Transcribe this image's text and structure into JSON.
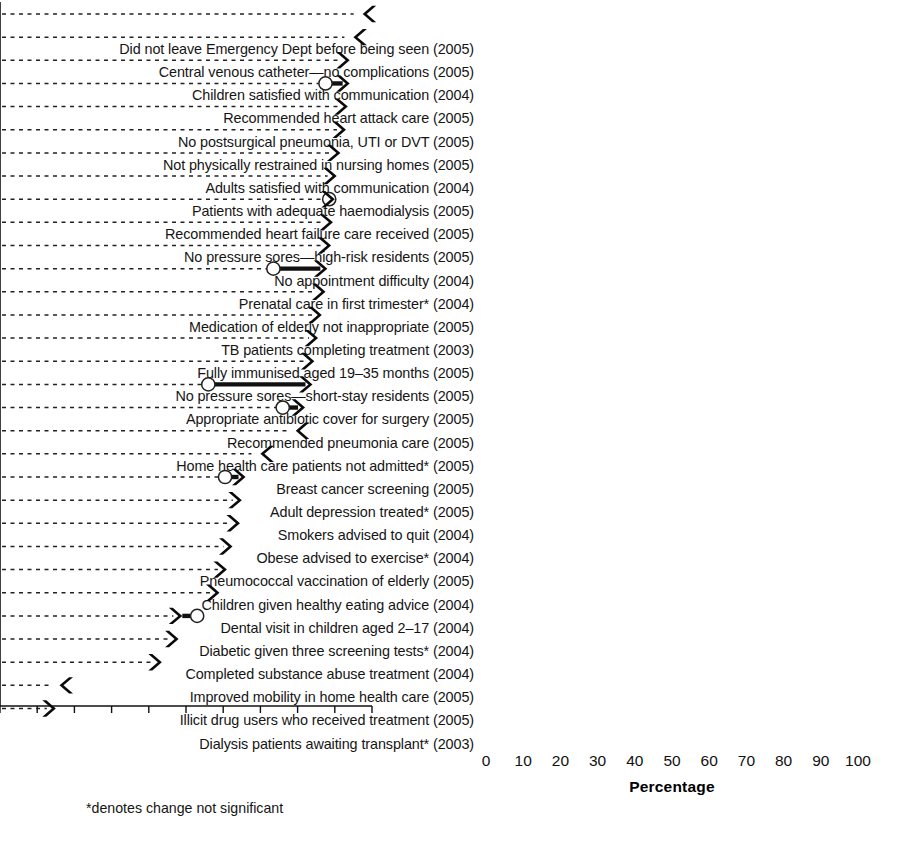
{
  "figure": {
    "footnote": "*denotes change not significant",
    "axis_title": "Percentage"
  },
  "chart_data": {
    "type": "bar",
    "orientation": "horizontal",
    "title": "",
    "xlabel": "Percentage",
    "ylabel": "",
    "xlim": [
      0,
      100
    ],
    "xticks": [
      0,
      10,
      20,
      30,
      40,
      50,
      60,
      70,
      80,
      90,
      100
    ],
    "grid": "dashed horizontal leader lines",
    "legend": null,
    "annotation": "*denotes change not significant",
    "marker_semantics": {
      "arrow": "current value / direction of change",
      "open_circle": "baseline (previous) value",
      "solid_bar": "magnitude of change"
    },
    "categories": [
      "Did not leave Emergency Dept before being seen (2005)",
      "Central venous catheter—no complications (2005)",
      "Children satisfied with communication (2004)",
      "Recommended heart attack care (2005)",
      "No postsurgical pneumonia, UTI or DVT (2005)",
      "Not physically restrained in nursing homes (2005)",
      "Adults satisfied with communication (2004)",
      "Patients with adequate haemodialysis (2005)",
      "Recommended heart failure care received (2005)",
      "No pressure sores—high-risk residents (2005)",
      "No appointment difficulty (2004)",
      "Prenatal care in first trimester* (2004)",
      "Medication of elderly not inappropriate (2005)",
      "TB patients completing treatment (2003)",
      "Fully immunised aged 19–35 months (2005)",
      "No pressure sores—short-stay residents (2005)",
      "Appropriate antibiotic cover for surgery (2005)",
      "Recommended pneumonia care (2005)",
      "Home health care patients not admitted* (2005)",
      "Breast cancer screening (2005)",
      "Adult depression treated* (2005)",
      "Smokers advised to quit (2004)",
      "Obese advised to exercise* (2004)",
      "Pneumococcal vaccination of elderly (2005)",
      "Children given healthy eating advice (2004)",
      "Dental visit in children aged 2–17 (2004)",
      "Diabetic given three screening tests* (2004)",
      "Completed substance abuse treatment (2004)",
      "Improved mobility in home health care (2005)",
      "Illicit drug users who received treatment (2005)",
      "Dialysis patients awaiting transplant* (2003)"
    ],
    "series": [
      {
        "name": "Current value (%)",
        "values": [
          97.5,
          95,
          94,
          94,
          93.5,
          93,
          91.5,
          90.5,
          90,
          89.5,
          89,
          88,
          87.5,
          86.5,
          85.5,
          84.5,
          84,
          82,
          79.5,
          70,
          66,
          65,
          64.5,
          62.5,
          61,
          59,
          49,
          48,
          43.5,
          16,
          15
        ]
      },
      {
        "name": "Baseline value (%)",
        "values": [
          null,
          null,
          null,
          87.5,
          null,
          null,
          null,
          null,
          88.5,
          null,
          null,
          73.5,
          null,
          null,
          null,
          null,
          56,
          76,
          null,
          null,
          60.5,
          null,
          null,
          null,
          null,
          null,
          53,
          null,
          null,
          null,
          null
        ]
      }
    ],
    "direction": [
      "left",
      "left",
      "right",
      "right",
      "right",
      "right",
      "right",
      "right",
      "right",
      "right",
      "right",
      "right",
      "right",
      "right",
      "right",
      "right",
      "right",
      "right",
      "left",
      "left",
      "right",
      "right",
      "right",
      "right",
      "right",
      "right",
      "right",
      "right",
      "right",
      "left",
      "right"
    ],
    "significant": [
      true,
      true,
      true,
      true,
      true,
      true,
      true,
      true,
      true,
      true,
      true,
      false,
      true,
      true,
      true,
      true,
      true,
      true,
      false,
      true,
      false,
      true,
      false,
      true,
      true,
      true,
      false,
      true,
      true,
      true,
      false
    ]
  },
  "rows": [
    {
      "label": "Did not leave Emergency Dept before being seen (2005)",
      "value": 97.5,
      "baseline": null,
      "dir": "left"
    },
    {
      "label": "Central venous catheter—no complications (2005)",
      "value": 95,
      "baseline": null,
      "dir": "left"
    },
    {
      "label": "Children satisfied with communication (2004)",
      "value": 94,
      "baseline": null,
      "dir": "right"
    },
    {
      "label": "Recommended heart attack care (2005)",
      "value": 94,
      "baseline": 87.5,
      "dir": "right"
    },
    {
      "label": "No postsurgical pneumonia, UTI or DVT (2005)",
      "value": 93.5,
      "baseline": null,
      "dir": "right"
    },
    {
      "label": "Not physically restrained in nursing homes (2005)",
      "value": 93,
      "baseline": null,
      "dir": "right"
    },
    {
      "label": "Adults satisfied with communication (2004)",
      "value": 91.5,
      "baseline": null,
      "dir": "right"
    },
    {
      "label": "Patients with adequate haemodialysis (2005)",
      "value": 90.5,
      "baseline": null,
      "dir": "right"
    },
    {
      "label": "Recommended heart failure care received (2005)",
      "value": 90,
      "baseline": 88.5,
      "dir": "right"
    },
    {
      "label": "No pressure sores—high-risk residents (2005)",
      "value": 89.5,
      "baseline": null,
      "dir": "right"
    },
    {
      "label": "No appointment difficulty (2004)",
      "value": 89,
      "baseline": null,
      "dir": "right"
    },
    {
      "label": "Prenatal care in first trimester* (2004)",
      "value": 88,
      "baseline": 73.5,
      "dir": "right"
    },
    {
      "label": "Medication of elderly not inappropriate (2005)",
      "value": 87.5,
      "baseline": null,
      "dir": "right"
    },
    {
      "label": "TB patients completing treatment (2003)",
      "value": 86.5,
      "baseline": null,
      "dir": "right"
    },
    {
      "label": "Fully immunised aged 19–35 months (2005)",
      "value": 85.5,
      "baseline": null,
      "dir": "right"
    },
    {
      "label": "No pressure sores—short-stay residents (2005)",
      "value": 84.5,
      "baseline": null,
      "dir": "right"
    },
    {
      "label": "Appropriate antibiotic cover for surgery (2005)",
      "value": 84,
      "baseline": 56,
      "dir": "right"
    },
    {
      "label": "Recommended pneumonia care (2005)",
      "value": 82,
      "baseline": 76,
      "dir": "right"
    },
    {
      "label": "Home health care patients not admitted* (2005)",
      "value": 79.5,
      "baseline": null,
      "dir": "left"
    },
    {
      "label": "Breast cancer screening (2005)",
      "value": 70,
      "baseline": null,
      "dir": "left"
    },
    {
      "label": "Adult depression treated* (2005)",
      "value": 66,
      "baseline": 60.5,
      "dir": "right"
    },
    {
      "label": "Smokers advised to quit (2004)",
      "value": 65,
      "baseline": null,
      "dir": "right"
    },
    {
      "label": "Obese advised to exercise* (2004)",
      "value": 64.5,
      "baseline": null,
      "dir": "right"
    },
    {
      "label": "Pneumococcal vaccination of elderly (2005)",
      "value": 62.5,
      "baseline": null,
      "dir": "right"
    },
    {
      "label": "Children given healthy eating advice (2004)",
      "value": 61,
      "baseline": null,
      "dir": "right"
    },
    {
      "label": "Dental visit in children aged 2–17 (2004)",
      "value": 59,
      "baseline": null,
      "dir": "right"
    },
    {
      "label": "Diabetic given three screening tests* (2004)",
      "value": 49,
      "baseline": 53,
      "dir": "right"
    },
    {
      "label": "Completed substance abuse treatment (2004)",
      "value": 48,
      "baseline": null,
      "dir": "right"
    },
    {
      "label": "Improved mobility in home health care (2005)",
      "value": 43.5,
      "baseline": null,
      "dir": "right"
    },
    {
      "label": "Illicit drug users who received treatment (2005)",
      "value": 16,
      "baseline": null,
      "dir": "left"
    },
    {
      "label": "Dialysis patients awaiting transplant* (2003)",
      "value": 15,
      "baseline": null,
      "dir": "right"
    }
  ]
}
